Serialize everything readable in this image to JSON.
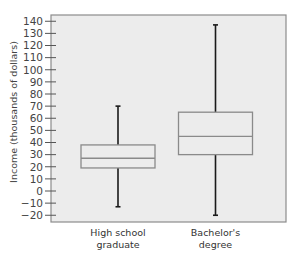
{
  "chart_data": {
    "type": "boxplot",
    "title": "",
    "xlabel": "",
    "ylabel": "Income (thousands of dollars)",
    "ylim": [
      -20,
      140
    ],
    "yticks": [
      -20,
      -10,
      0,
      10,
      20,
      30,
      40,
      50,
      60,
      70,
      80,
      90,
      100,
      110,
      120,
      130,
      140
    ],
    "ytick_labels": [
      "−20",
      "−10",
      "0",
      "10",
      "20",
      "30",
      "40",
      "50",
      "60",
      "70",
      "80",
      "90",
      "100",
      "110",
      "120",
      "130",
      "140"
    ],
    "grid": false,
    "legend": null,
    "categories": [
      {
        "line1": "High school",
        "line2": "graduate"
      },
      {
        "line1": "Bachelor's",
        "line2": "degree"
      }
    ],
    "series": [
      {
        "name": "High school graduate",
        "whisker_low": -13,
        "q1": 19,
        "median": 27,
        "q3": 38,
        "whisker_high": 70
      },
      {
        "name": "Bachelor's degree",
        "whisker_low": -20,
        "q1": 30,
        "median": 45,
        "q3": 65,
        "whisker_high": 137
      }
    ],
    "colors": {
      "plot_background": "#ececec",
      "frame": "#8c8c8c",
      "box_stroke": "#8a8a8a",
      "whisker": "#1a1a1a"
    }
  }
}
